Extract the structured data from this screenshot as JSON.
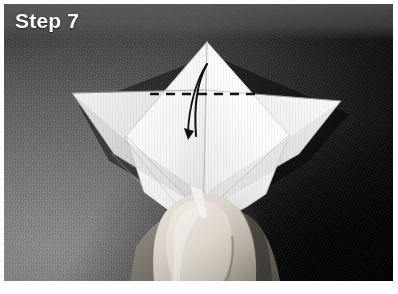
{
  "figure": {
    "caption": "Step 7",
    "kind": "origami-instruction-photograph",
    "background_description": "dark grey textured cloth, lighter at lower left"
  },
  "colors": {
    "caption_text": "#ffffff",
    "caption_band": "#6c6c6c",
    "background_light": "#8e8e8e",
    "background_mid": "#636363",
    "background_dark": "#343434",
    "background_darkest": "#050505",
    "paper_white": "#fdfdfd",
    "paper_shadow": "#c9c9c9",
    "annotation_ink": "#111111",
    "page_margin": "#ffffff",
    "thumb_skin": "#d6d0c8"
  },
  "annotations": {
    "fold_line": {
      "type": "valley-fold-dashed-line",
      "orientation": "horizontal",
      "x_start": 146,
      "x_end": 252,
      "y": 90,
      "dash_length": 9,
      "gap_length": 7,
      "stroke_width": 2.4
    },
    "fold_arrow": {
      "type": "curved-fold-arrow",
      "direction": "downward",
      "description": "narrow hairpin arc rising from lower left, curving up past the apex and returning down with the arrowhead pointing down-left"
    }
  },
  "model_geometry": {
    "apex": [
      203,
      38
    ],
    "left_wing_tip": [
      68,
      89
    ],
    "right_wing_tip": [
      337,
      97
    ],
    "bottom_point": [
      199,
      205
    ],
    "center_crease_x": 199
  },
  "photo_frame": {
    "width": 398,
    "height": 294,
    "plate_left": 4,
    "plate_top": 4,
    "plate_width": 389,
    "plate_height": 277
  }
}
